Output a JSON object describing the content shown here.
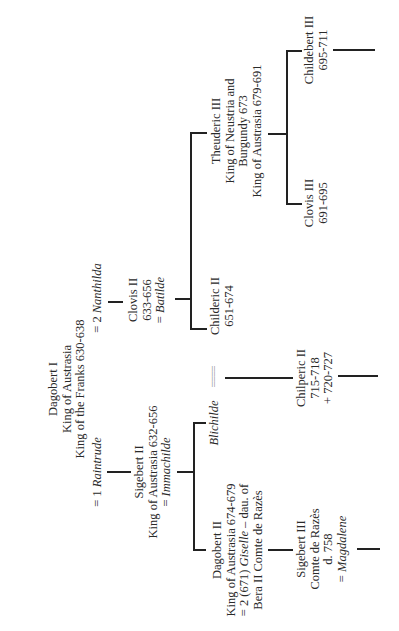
{
  "diagram": {
    "type": "family-tree",
    "orientation": "rotated-90-ccw",
    "nodes": {
      "dagobert_i": {
        "lines": [
          "Dagobert I",
          "King of Austrasia",
          "King of the Franks 630-638"
        ]
      },
      "spouse_nanthilda": {
        "prefix": "= 2 ",
        "name": "Nanthilda"
      },
      "spouse_raintrude": {
        "prefix": "= 1 ",
        "name": "Raintrude"
      },
      "clovis_ii": {
        "lines": [
          "Clovis II",
          "633-656"
        ],
        "spouse_prefix": "= ",
        "spouse": "Batilde"
      },
      "sigebert_ii": {
        "lines": [
          "Sigebert II",
          "King of Austrasia 632-656"
        ],
        "spouse_prefix": "= ",
        "spouse": "Immachilde"
      },
      "theuderic_iii": {
        "lines": [
          "Theuderic III",
          "King of Neustria and",
          "Burgundy 673",
          "King of Austrasia 679-691"
        ]
      },
      "childeric_ii": {
        "lines": [
          "Childeric II",
          "651-674"
        ]
      },
      "blichilde": {
        "name": "Blichilde"
      },
      "marriage_link": {
        "symbol": "===="
      },
      "childebert_iii": {
        "lines": [
          "Childebert III",
          "695-711"
        ]
      },
      "clovis_iii": {
        "lines": [
          "Clovis III",
          "691-695"
        ]
      },
      "chilperic_ii": {
        "lines": [
          "Chilperic II",
          "715-718",
          "+ 720-727"
        ]
      },
      "dagobert_ii": {
        "line1": "Dagobert II",
        "line2": "King of Austrasia 674-679",
        "line3_prefix": "= 2 (671) ",
        "line3_italic": "Giselle",
        "line3_suffix": " – dau. of",
        "line4": "Bera II Comte de Razès"
      },
      "sigebert_iii": {
        "lines": [
          "Sigebert III",
          "Comte de Razès",
          "d. 758"
        ],
        "spouse_prefix": "= ",
        "spouse": "Magdalene"
      }
    }
  }
}
